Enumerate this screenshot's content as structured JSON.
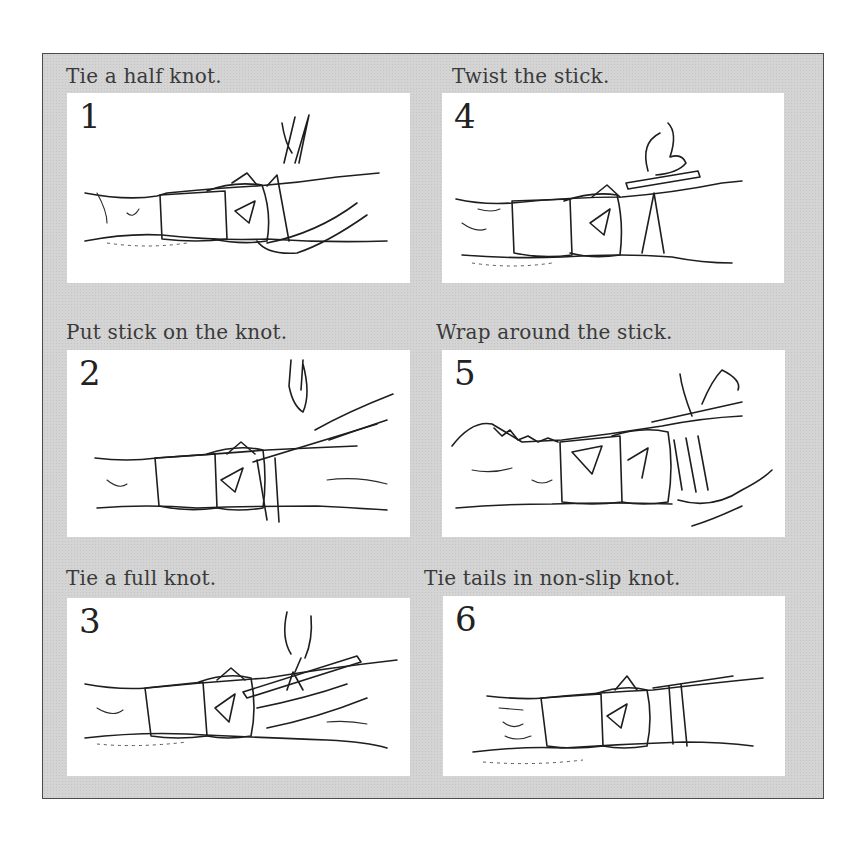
{
  "diagram": {
    "type": "instructional-steps",
    "steps": [
      {
        "number": "1",
        "caption": "Tie a half knot."
      },
      {
        "number": "2",
        "caption": "Put stick on the knot."
      },
      {
        "number": "3",
        "caption": "Tie a full knot."
      },
      {
        "number": "4",
        "caption": "Twist the stick."
      },
      {
        "number": "5",
        "caption": "Wrap around the stick."
      },
      {
        "number": "6",
        "caption": "Tie tails in non-slip knot."
      }
    ]
  },
  "colors": {
    "frame_background": "#d4d4d4",
    "frame_border": "#4a4a4a",
    "panel_background": "#ffffff",
    "caption_text": "#3a3a3a",
    "line_art": "#1e1e1e"
  }
}
